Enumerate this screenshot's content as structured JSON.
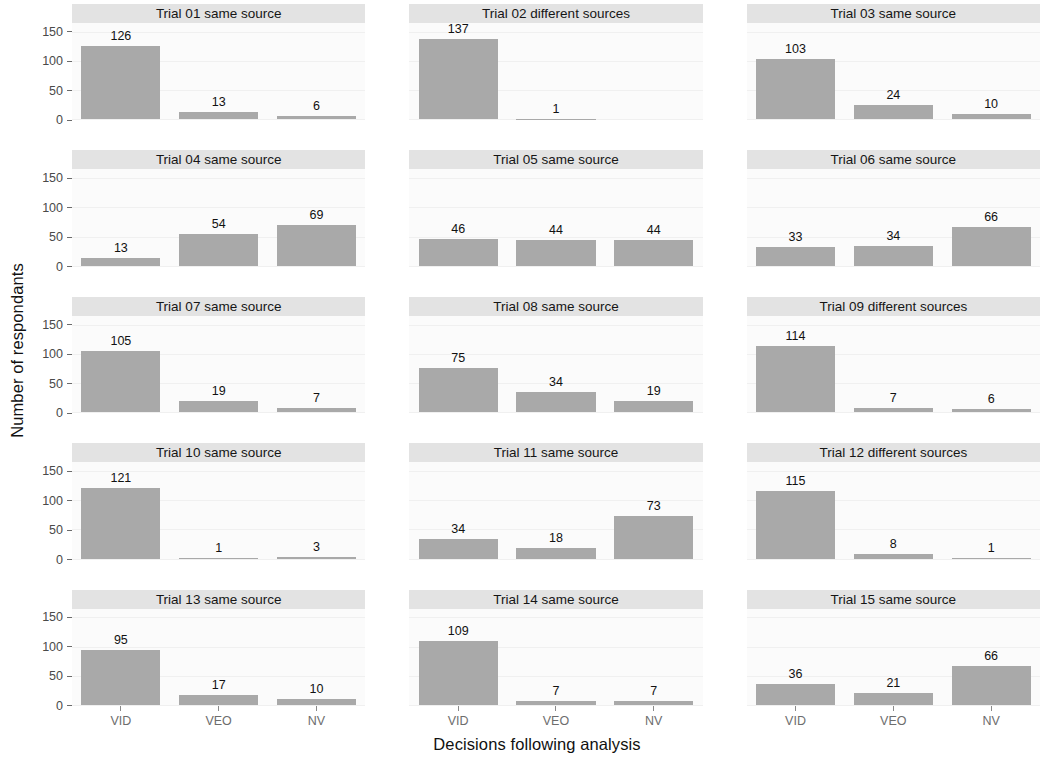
{
  "chart_data": {
    "type": "bar",
    "title": "",
    "xlabel": "Decisions following analysis",
    "ylabel": "Number of respondants",
    "categories": [
      "VID",
      "VEO",
      "NV"
    ],
    "yticks": [
      0,
      50,
      100,
      150
    ],
    "ylim": [
      0,
      165
    ],
    "grid": true,
    "legend": "none",
    "facet_layout": {
      "rows": 5,
      "cols": 3
    },
    "bar_color": "#a9a9a9",
    "strip_color": "#e3e3e3",
    "panels": [
      {
        "title": "Trial 01 same source",
        "values": [
          126,
          13,
          6
        ],
        "labels": [
          "126",
          "13",
          "6"
        ]
      },
      {
        "title": "Trial 02 different sources",
        "values": [
          137,
          1,
          0
        ],
        "labels": [
          "137",
          "1",
          ""
        ]
      },
      {
        "title": "Trial 03 same source",
        "values": [
          103,
          24,
          10
        ],
        "labels": [
          "103",
          "24",
          "10"
        ]
      },
      {
        "title": "Trial 04 same source",
        "values": [
          13,
          54,
          69
        ],
        "labels": [
          "13",
          "54",
          "69"
        ]
      },
      {
        "title": "Trial 05 same source",
        "values": [
          46,
          44,
          44
        ],
        "labels": [
          "46",
          "44",
          "44"
        ]
      },
      {
        "title": "Trial 06 same source",
        "values": [
          33,
          34,
          66
        ],
        "labels": [
          "33",
          "34",
          "66"
        ]
      },
      {
        "title": "Trial 07 same source",
        "values": [
          105,
          19,
          7
        ],
        "labels": [
          "105",
          "19",
          "7"
        ]
      },
      {
        "title": "Trial 08 same source",
        "values": [
          75,
          34,
          19
        ],
        "labels": [
          "75",
          "34",
          "19"
        ]
      },
      {
        "title": "Trial 09 different sources",
        "values": [
          114,
          7,
          6
        ],
        "labels": [
          "114",
          "7",
          "6"
        ]
      },
      {
        "title": "Trial 10 same source",
        "values": [
          121,
          1,
          3
        ],
        "labels": [
          "121",
          "1",
          "3"
        ]
      },
      {
        "title": "Trial 11 same source",
        "values": [
          34,
          18,
          73
        ],
        "labels": [
          "34",
          "18",
          "73"
        ]
      },
      {
        "title": "Trial 12 different sources",
        "values": [
          115,
          8,
          1
        ],
        "labels": [
          "115",
          "8",
          "1"
        ]
      },
      {
        "title": "Trial 13 same source",
        "values": [
          95,
          17,
          10
        ],
        "labels": [
          "95",
          "17",
          "10"
        ]
      },
      {
        "title": "Trial 14 same source",
        "values": [
          109,
          7,
          7
        ],
        "labels": [
          "109",
          "7",
          "7"
        ]
      },
      {
        "title": "Trial 15 same source",
        "values": [
          36,
          21,
          66
        ],
        "labels": [
          "36",
          "21",
          "66"
        ]
      }
    ]
  },
  "axis": {
    "y_title": "Number of respondants",
    "x_title": "Decisions following analysis",
    "y_tick_labels": [
      "150",
      "100",
      "50",
      "0"
    ],
    "x_tick_labels": [
      "VID",
      "VEO",
      "NV"
    ]
  }
}
